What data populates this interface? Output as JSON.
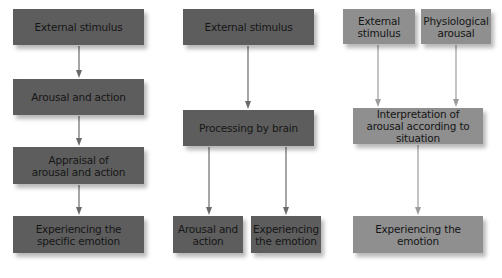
{
  "diagram": {
    "colors": {
      "dark_box": "#5d5d5d",
      "light_box": "#8f8f8f",
      "arrow_dark": "#6a6a6a",
      "arrow_light": "#9c9c9c",
      "text": "#161616"
    },
    "columns": [
      {
        "name": "left",
        "nodes": [
          {
            "id": "L1",
            "label": "External stimulus"
          },
          {
            "id": "L2",
            "label": "Arousal and action"
          },
          {
            "id": "L3",
            "label": "Appraisal of arousal and action"
          },
          {
            "id": "L4",
            "label": "Experiencing the specific emotion"
          }
        ],
        "edges": [
          [
            "L1",
            "L2"
          ],
          [
            "L2",
            "L3"
          ],
          [
            "L3",
            "L4"
          ]
        ]
      },
      {
        "name": "middle",
        "nodes": [
          {
            "id": "M1",
            "label": "External stimulus"
          },
          {
            "id": "M2",
            "label": "Processing by brain"
          },
          {
            "id": "M3",
            "label": "Arousal and action"
          },
          {
            "id": "M4",
            "label": "Experiencing the emotion"
          }
        ],
        "edges": [
          [
            "M1",
            "M2"
          ],
          [
            "M2",
            "M3"
          ],
          [
            "M2",
            "M4"
          ]
        ]
      },
      {
        "name": "right",
        "nodes": [
          {
            "id": "R1",
            "label": "External stimulus"
          },
          {
            "id": "R2",
            "label": "Physiological arousal"
          },
          {
            "id": "R3",
            "label": "Interpretation of arousal according to situation"
          },
          {
            "id": "R4",
            "label": "Experiencing the emotion"
          }
        ],
        "edges": [
          [
            "R1",
            "R3"
          ],
          [
            "R2",
            "R3"
          ],
          [
            "R3",
            "R4"
          ]
        ]
      }
    ]
  }
}
